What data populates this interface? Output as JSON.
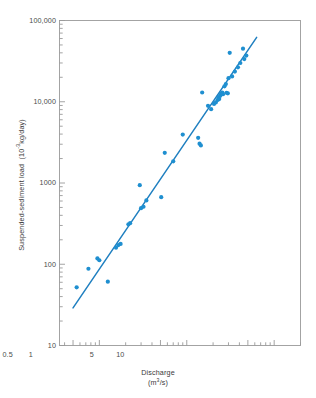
{
  "chart_data": {
    "type": "scatter",
    "title": "",
    "xlabel": "Discharge",
    "xlabel_units": "(m3/s)",
    "xlabel_units_base": "(m",
    "xlabel_units_exp": "3",
    "xlabel_units_tail": "/s)",
    "ylabel": "Suspended-sediment load",
    "ylabel_units_base": "(10",
    "ylabel_units_exp": "-3",
    "ylabel_units_tail": "kg/day)",
    "xscale": "log",
    "yscale": "log",
    "xlim": [
      0.035,
      20
    ],
    "ylim": [
      10,
      100000
    ],
    "grid": false,
    "legend": false,
    "xticks": [
      0.05,
      0.1,
      0.5,
      1,
      5,
      10
    ],
    "xtick_labels": [
      "0.05",
      "0.1",
      "0.5",
      "1",
      "5",
      "10"
    ],
    "yticks": [
      10,
      100,
      1000,
      10000,
      100000
    ],
    "ytick_labels": [
      "10",
      "100",
      "1000",
      "10,000",
      "100,000"
    ],
    "marker_color": "#1f8fd0",
    "line_color": "#1f7fc0",
    "axis_color": "#9a9a9a",
    "marker_size_px": 4.2,
    "points": [
      [
        0.055,
        52
      ],
      [
        0.075,
        88
      ],
      [
        0.095,
        118
      ],
      [
        0.1,
        112
      ],
      [
        0.125,
        61
      ],
      [
        0.155,
        160
      ],
      [
        0.165,
        172
      ],
      [
        0.175,
        178
      ],
      [
        0.215,
        310
      ],
      [
        0.225,
        320
      ],
      [
        0.29,
        940
      ],
      [
        0.3,
        490
      ],
      [
        0.32,
        510
      ],
      [
        0.345,
        610
      ],
      [
        0.51,
        670
      ],
      [
        0.56,
        2350
      ],
      [
        0.7,
        1850
      ],
      [
        0.9,
        3950
      ],
      [
        1.35,
        3600
      ],
      [
        1.4,
        3050
      ],
      [
        1.45,
        2900
      ],
      [
        1.5,
        13000
      ],
      [
        1.75,
        8900
      ],
      [
        1.9,
        8100
      ],
      [
        2.05,
        9400
      ],
      [
        2.15,
        9800
      ],
      [
        2.25,
        10500
      ],
      [
        2.3,
        11200
      ],
      [
        2.35,
        10800
      ],
      [
        2.4,
        11800
      ],
      [
        2.45,
        12200
      ],
      [
        2.5,
        12600
      ],
      [
        2.55,
        13000
      ],
      [
        2.6,
        12400
      ],
      [
        2.7,
        15500
      ],
      [
        2.8,
        16500
      ],
      [
        2.85,
        12900
      ],
      [
        2.95,
        12700
      ],
      [
        3.0,
        19500
      ],
      [
        3.1,
        40000
      ],
      [
        3.3,
        20500
      ],
      [
        3.55,
        23500
      ],
      [
        3.85,
        26500
      ],
      [
        4.1,
        30000
      ],
      [
        4.4,
        45000
      ],
      [
        4.55,
        33500
      ],
      [
        4.8,
        37000
      ]
    ],
    "fit_line": {
      "x_start": 0.05,
      "y_start": 29,
      "x_end": 6.3,
      "y_end": 62000
    }
  }
}
